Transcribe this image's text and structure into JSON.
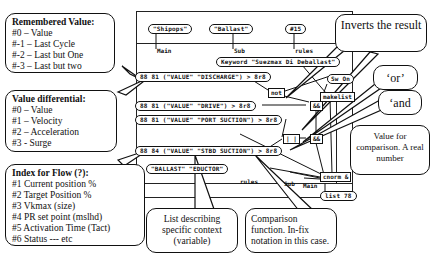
{
  "callouts": {
    "remembered": {
      "title": "Remembered Value:",
      "lines": [
        "#0 – Value",
        "#-1 – Last Cycle",
        "#-2 – Last but One",
        "#-3 – Last but two"
      ]
    },
    "differential": {
      "title": "Value differential:",
      "lines": [
        "#0 – Value",
        "#1 – Velocity",
        "#2 – Acceleration",
        "#3 - Surge"
      ]
    },
    "flow_index": {
      "title": "Index for Flow (?):",
      "lines": [
        "#1 Current position %",
        "#2 Target Position %",
        "#3 Vkmax (size)",
        "#4 PR set point (mslhd)",
        "#5 Activation Time (Tact)",
        "#6 Status --- etc"
      ]
    },
    "inverts": {
      "text": "Inverts the result"
    },
    "or": {
      "text": "‘or’"
    },
    "and": {
      "text": "‘and"
    },
    "value_cmp": {
      "text": "Value for comparison. A real number"
    },
    "list_ctx": {
      "text": "List describing specific context (variable)"
    },
    "cmp_fn": {
      "text": "Comparison function. In-fix notation in this case."
    }
  },
  "graph": {
    "top_nodes": [
      "\"Shipops\"",
      "\"Ballast\"",
      "#15"
    ],
    "top_labels": [
      "Main",
      "Sub",
      "rules"
    ],
    "keyword_node": "Keyword \"Suezmax Di Deballast\"",
    "switch_on": "Sw On",
    "not_box": "not",
    "makelist_box": "makelist",
    "or_box": "| |",
    "and1_box": "&&",
    "and2_box": "&&",
    "conditions": [
      "88 81 (\"VALUE\" \"DISCHARGE\") > 8r8",
      "88 81 (\"VALUE\" \"DRIVE\") > 8r8",
      "88 81 (\"VALUE\" \"PORT SUCTION\") > 8r8",
      "88 84 (\"VALUE\" \"STBD SUCTION\") > 8r8"
    ],
    "context_node": "\"BALLAST\" \"EDUCTOR\"",
    "bottom_labels": [
      "rules",
      "Sub",
      "Main"
    ],
    "cnorm_box": "cnorm &",
    "list_node": "list 78"
  }
}
